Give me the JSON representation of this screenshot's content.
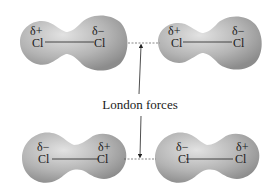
{
  "diagram": {
    "label": "London forces",
    "molecules": [
      {
        "id": "top-left",
        "left_atom": {
          "symbol": "Cl",
          "charge": "δ+"
        },
        "right_atom": {
          "symbol": "Cl",
          "charge": "δ−"
        }
      },
      {
        "id": "top-right",
        "left_atom": {
          "symbol": "Cl",
          "charge": "δ+"
        },
        "right_atom": {
          "symbol": "Cl",
          "charge": "δ−"
        }
      },
      {
        "id": "bottom-left",
        "left_atom": {
          "symbol": "Cl",
          "charge": "δ−"
        },
        "right_atom": {
          "symbol": "Cl",
          "charge": "δ+"
        }
      },
      {
        "id": "bottom-right",
        "left_atom": {
          "symbol": "Cl",
          "charge": "δ−"
        },
        "right_atom": {
          "symbol": "Cl",
          "charge": "δ+"
        }
      }
    ],
    "colors": {
      "molecule_light": "#d8d8d8",
      "molecule_dark": "#8a8a8a",
      "text": "#1a1a1a"
    }
  }
}
